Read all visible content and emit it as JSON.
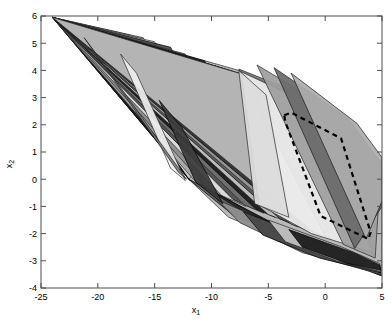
{
  "figure": {
    "type": "polygon-overlay-plot",
    "background": "#ffffff",
    "axes_color": "#4d4d4d",
    "plot_box_px": {
      "left": 41,
      "top": 16,
      "right": 382,
      "bottom": 288
    }
  },
  "axes": {
    "x": {
      "label_main": "x",
      "label_sub": "1",
      "min": -25,
      "max": 5,
      "ticks": [
        -25,
        -20,
        -15,
        -10,
        -5,
        0,
        5
      ],
      "tick_labels": [
        "-25",
        "-20",
        "-15",
        "-10",
        "-5",
        "0",
        "5"
      ]
    },
    "y": {
      "label_main": "x",
      "label_sub": "2",
      "min": -4,
      "max": 6,
      "ticks": [
        -4,
        -3,
        -2,
        -1,
        0,
        1,
        2,
        3,
        4,
        5,
        6
      ],
      "tick_labels": [
        "-4",
        "-3",
        "-2",
        "-1",
        "0",
        "1",
        "2",
        "3",
        "4",
        "5",
        "6"
      ]
    }
  },
  "chart_data": {
    "type": "area",
    "title": "",
    "xlabel": "x_1",
    "ylabel": "x_2",
    "xlim": [
      -25,
      5
    ],
    "ylim": [
      -4,
      6
    ],
    "grid": false,
    "legend": null,
    "apex": [
      -24,
      5.95
    ],
    "outline_color": "#1a1a1a",
    "polygons": [
      {
        "name": "hull-outer",
        "fill": "#b4b4b4",
        "stroke": "#2b2b2b",
        "points": [
          [
            -24,
            5.95
          ],
          [
            -7.6,
            4.0
          ],
          [
            0.2,
            2.6
          ],
          [
            5.0,
            0.6
          ],
          [
            5.0,
            -3.55
          ],
          [
            -1.5,
            -2.6
          ],
          [
            -8.5,
            -1.4
          ],
          [
            -12.0,
            0.0
          ]
        ]
      },
      {
        "name": "poly-01",
        "fill": "#d2d2d2",
        "stroke": "#262626",
        "points": [
          [
            -24,
            5.95
          ],
          [
            -18.5,
            5.3
          ],
          [
            -11.8,
            0.1
          ],
          [
            -12.0,
            0.0
          ]
        ]
      },
      {
        "name": "poly-02",
        "fill": "#0d0d0d",
        "stroke": "#000000",
        "points": [
          [
            -24,
            5.95
          ],
          [
            -20.4,
            5.05
          ],
          [
            -11.9,
            -0.05
          ],
          [
            -12.0,
            0.0
          ]
        ]
      },
      {
        "name": "poly-03",
        "fill": "#a8a8a8",
        "stroke": "#262626",
        "points": [
          [
            -24,
            5.95
          ],
          [
            -17.2,
            5.3
          ],
          [
            -9.6,
            -0.55
          ],
          [
            -11.6,
            0.0
          ]
        ]
      },
      {
        "name": "poly-04",
        "fill": "#8c8c8c",
        "stroke": "#262626",
        "points": [
          [
            -24,
            5.95
          ],
          [
            -16.0,
            5.2
          ],
          [
            -8.2,
            -0.85
          ],
          [
            -10.2,
            -0.4
          ]
        ]
      },
      {
        "name": "poly-05",
        "fill": "#e0e0e0",
        "stroke": "#262626",
        "points": [
          [
            -24,
            5.95
          ],
          [
            -15.0,
            5.05
          ],
          [
            -7.0,
            -1.0
          ],
          [
            -9.1,
            -0.6
          ]
        ]
      },
      {
        "name": "poly-06",
        "fill": "#4a4a4a",
        "stroke": "#000000",
        "points": [
          [
            -24,
            5.95
          ],
          [
            -13.6,
            4.85
          ],
          [
            -6.2,
            -1.1
          ],
          [
            -8.1,
            -0.75
          ]
        ]
      },
      {
        "name": "poly-07",
        "fill": "#707070",
        "stroke": "#262626",
        "points": [
          [
            -24,
            5.95
          ],
          [
            -12.3,
            4.6
          ],
          [
            -5.4,
            -1.25
          ],
          [
            -7.1,
            -0.95
          ]
        ]
      },
      {
        "name": "poly-08",
        "fill": "#1c1c1c",
        "stroke": "#000000",
        "points": [
          [
            -24,
            5.95
          ],
          [
            -10.6,
            4.35
          ],
          [
            -4.4,
            -1.4
          ],
          [
            -6.1,
            -1.1
          ]
        ]
      },
      {
        "name": "poly-09",
        "fill": "#c8c8c8",
        "stroke": "#262626",
        "points": [
          [
            -24,
            5.95
          ],
          [
            -9.6,
            4.15
          ],
          [
            -3.4,
            -1.55
          ],
          [
            -5.0,
            -1.3
          ]
        ]
      },
      {
        "name": "poly-10",
        "fill": "#565656",
        "stroke": "#000000",
        "points": [
          [
            -24,
            5.95
          ],
          [
            -8.8,
            4.05
          ],
          [
            -2.4,
            -1.75
          ],
          [
            -4.0,
            -1.45
          ]
        ]
      },
      {
        "name": "poly-11",
        "fill": "#9a9a9a",
        "stroke": "#262626",
        "points": [
          [
            -24,
            5.95
          ],
          [
            -8.0,
            3.95
          ],
          [
            -1.4,
            -1.9
          ],
          [
            -3.0,
            -1.65
          ]
        ]
      },
      {
        "name": "poly-12",
        "fill": "#303030",
        "stroke": "#000000",
        "points": [
          [
            -24,
            5.95
          ],
          [
            -7.6,
            3.9
          ],
          [
            -0.4,
            -2.05
          ],
          [
            -2.0,
            -1.8
          ]
        ]
      },
      {
        "name": "poly-13",
        "fill": "#bdbdbd",
        "stroke": "#262626",
        "points": [
          [
            -24,
            5.95
          ],
          [
            -7.2,
            3.85
          ],
          [
            0.6,
            -2.2
          ],
          [
            -1.0,
            -1.95
          ]
        ]
      },
      {
        "name": "poly-14",
        "fill": "#787878",
        "stroke": "#262626",
        "points": [
          [
            -7.6,
            4.05
          ],
          [
            -1.0,
            2.95
          ],
          [
            3.4,
            -2.45
          ],
          [
            0.0,
            -2.1
          ]
        ]
      },
      {
        "name": "poly-15",
        "fill": "#eeeeee",
        "stroke": "#2b2b2b",
        "points": [
          [
            -7.4,
            3.95
          ],
          [
            -0.2,
            2.55
          ],
          [
            4.2,
            -2.7
          ],
          [
            -1.2,
            -2.0
          ],
          [
            -5.8,
            -0.95
          ]
        ]
      },
      {
        "name": "poly-16",
        "fill": "#9e9e9e",
        "stroke": "#262626",
        "points": [
          [
            -6.0,
            4.2
          ],
          [
            1.2,
            2.4
          ],
          [
            4.9,
            0.4
          ],
          [
            4.4,
            -2.9
          ],
          [
            1.6,
            -2.4
          ]
        ]
      },
      {
        "name": "poly-17",
        "fill": "#6b6b6b",
        "stroke": "#1a1a1a",
        "points": [
          [
            -4.5,
            4.1
          ],
          [
            2.0,
            2.25
          ],
          [
            5.0,
            0.55
          ],
          [
            5.0,
            -1.0
          ],
          [
            2.6,
            -2.55
          ]
        ]
      },
      {
        "name": "poly-18",
        "fill": "#acacac",
        "stroke": "#1a1a1a",
        "points": [
          [
            -3.0,
            3.9
          ],
          [
            2.8,
            2.05
          ],
          [
            5.0,
            0.8
          ],
          [
            5.0,
            -0.8
          ],
          [
            3.6,
            -2.2
          ]
        ]
      },
      {
        "name": "poly-19",
        "fill": "#5e5e5e",
        "stroke": "#000000",
        "points": [
          [
            -12.0,
            0.0
          ],
          [
            -8.0,
            -1.35
          ],
          [
            0.5,
            -2.75
          ],
          [
            4.6,
            -3.5
          ],
          [
            5.0,
            -3.55
          ],
          [
            -1.2,
            -2.35
          ]
        ]
      },
      {
        "name": "poly-20",
        "fill": "#2a2a2a",
        "stroke": "#000000",
        "points": [
          [
            -11.2,
            -0.15
          ],
          [
            -6.0,
            -1.5
          ],
          [
            2.0,
            -3.0
          ],
          [
            4.9,
            -3.45
          ],
          [
            0.0,
            -2.6
          ],
          [
            -5.5,
            -1.45
          ]
        ]
      },
      {
        "name": "poly-21",
        "fill": "#8f8f8f",
        "stroke": "#1f1f1f",
        "points": [
          [
            -9.5,
            -0.75
          ],
          [
            -3.5,
            -1.85
          ],
          [
            4.4,
            -3.3
          ],
          [
            4.9,
            -3.5
          ],
          [
            -2.0,
            -2.7
          ],
          [
            -7.5,
            -1.6
          ]
        ]
      },
      {
        "name": "poly-22",
        "fill": "#454545",
        "stroke": "#000000",
        "points": [
          [
            -7.2,
            -1.2
          ],
          [
            -1.0,
            -2.2
          ],
          [
            4.6,
            -3.25
          ],
          [
            4.9,
            -3.45
          ],
          [
            -0.5,
            -2.9
          ],
          [
            -5.5,
            -2.05
          ]
        ]
      },
      {
        "name": "poly-23",
        "fill": "#c4c4c4",
        "stroke": "#1f1f1f",
        "points": [
          [
            -5.0,
            -1.5
          ],
          [
            1.5,
            -2.5
          ],
          [
            4.8,
            -3.1
          ],
          [
            4.9,
            -3.4
          ],
          [
            1.0,
            -3.0
          ],
          [
            -3.5,
            -2.3
          ]
        ]
      },
      {
        "name": "poly-24",
        "fill": "#1a1a1a",
        "stroke": "#000000",
        "points": [
          [
            -3.2,
            -1.85
          ],
          [
            2.5,
            -2.7
          ],
          [
            4.8,
            -3.15
          ],
          [
            4.9,
            -3.35
          ],
          [
            2.0,
            -3.1
          ],
          [
            -2.0,
            -2.5
          ]
        ]
      },
      {
        "name": "poly-25",
        "fill": "#dcdcdc",
        "stroke": "#262626",
        "points": [
          [
            -7.6,
            4.0
          ],
          [
            -5.2,
            3.1
          ],
          [
            -3.2,
            -1.4
          ],
          [
            -6.2,
            -0.9
          ]
        ]
      },
      {
        "name": "poly-26",
        "fill": "#3a3a3a",
        "stroke": "#000000",
        "points": [
          [
            -14.6,
            2.9
          ],
          [
            -12.6,
            1.9
          ],
          [
            -9.0,
            -0.9
          ],
          [
            -11.4,
            -0.1
          ]
        ]
      },
      {
        "name": "poly-27",
        "fill": "#ededed",
        "stroke": "#2b2b2b",
        "points": [
          [
            -18.0,
            4.6
          ],
          [
            -16.6,
            3.9
          ],
          [
            -12.3,
            -0.05
          ],
          [
            -13.6,
            0.4
          ]
        ]
      },
      {
        "name": "poly-28",
        "fill": "#7d7d7d",
        "stroke": "#1f1f1f",
        "points": [
          [
            -21.2,
            5.2
          ],
          [
            -20.3,
            4.7
          ],
          [
            -12.2,
            -0.0
          ],
          [
            -12.9,
            0.25
          ]
        ]
      }
    ],
    "dashed_polygon": {
      "name": "dashed-region",
      "stroke": "#000000",
      "stroke_width": 2.2,
      "dash": "5,4",
      "fill": "none",
      "points": [
        [
          -3.6,
          2.35
        ],
        [
          -3.0,
          2.45
        ],
        [
          1.4,
          1.5
        ],
        [
          4.0,
          -1.95
        ],
        [
          3.8,
          -2.2
        ],
        [
          -0.4,
          -1.35
        ],
        [
          -3.5,
          2.1
        ]
      ]
    }
  }
}
